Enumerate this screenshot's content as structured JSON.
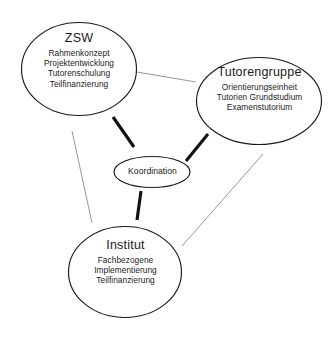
{
  "diagram": {
    "type": "venn-style relationship diagram",
    "background_color": "#ffffff",
    "stroke_color": "#1a1a1a",
    "thin_link_color": "#8a8a8a",
    "thick_link_color": "#111111",
    "nodes": [
      {
        "id": "zsw",
        "title": "ZSW",
        "details": [
          "Rahmenkonzept",
          "Projektentwicklung",
          "Tutorenschulung",
          "Teilfinanzierung"
        ]
      },
      {
        "id": "tutorengruppe",
        "title": "Tutorengruppe",
        "details": [
          "Orientierungseinheit",
          "Tutorien Grundstudium",
          "Examenstutorium"
        ]
      },
      {
        "id": "institut",
        "title": "Institut",
        "details": [
          "Fachbezogene",
          "Implementierung",
          "Teilfinanzierung"
        ]
      }
    ],
    "hub": {
      "id": "koordination",
      "title": "Koordination"
    },
    "links": [
      {
        "from": "zsw",
        "to": "tutorengruppe",
        "weight": "thin"
      },
      {
        "from": "zsw",
        "to": "institut",
        "weight": "thin"
      },
      {
        "from": "tutorengruppe",
        "to": "institut",
        "weight": "thin"
      },
      {
        "from": "zsw",
        "to": "koordination",
        "weight": "thick"
      },
      {
        "from": "tutorengruppe",
        "to": "koordination",
        "weight": "thick"
      },
      {
        "from": "institut",
        "to": "koordination",
        "weight": "thick"
      }
    ]
  }
}
